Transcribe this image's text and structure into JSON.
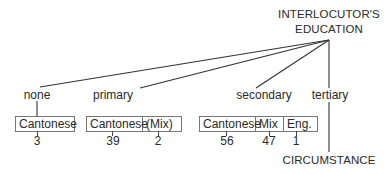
{
  "root": {
    "line1": "INTERLOCUTOR'S",
    "line2": "EDUCATION"
  },
  "branches": [
    {
      "label": "none",
      "cells": [
        {
          "label": "Cantonese",
          "count": "3"
        }
      ]
    },
    {
      "label": "primary",
      "cells": [
        {
          "label": "Cantonese",
          "count": "39"
        },
        {
          "label": "(Mix)",
          "count": "2"
        }
      ]
    },
    {
      "label": "secondary",
      "cells": [
        {
          "label": "Cantonese",
          "count": "56"
        },
        {
          "label": "Mix",
          "count": "47"
        },
        {
          "label": "Eng.",
          "count": "1"
        }
      ]
    },
    {
      "label": "tertiary",
      "child": "CIRCUMSTANCE"
    }
  ],
  "colors": {
    "line": "#333333",
    "text": "#2a2a2a",
    "box_border": "#777777"
  }
}
